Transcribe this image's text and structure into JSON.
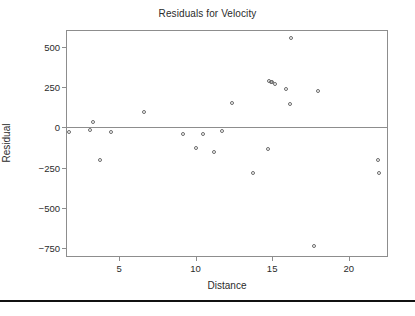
{
  "chart_data": {
    "type": "scatter",
    "title": "Residuals for Velocity",
    "xlabel": "Distance",
    "ylabel": "Residual",
    "xlim": [
      1.6,
      22.5
    ],
    "ylim": [
      -800,
      600
    ],
    "xticks": [
      5,
      10,
      15,
      20
    ],
    "xtick_labels": [
      "5",
      "10",
      "15",
      "20"
    ],
    "yticks": [
      500,
      250,
      0,
      -250,
      -500,
      -750
    ],
    "ytick_labels": [
      "500",
      "250",
      "0",
      "-250",
      "-500",
      "-750"
    ],
    "grid": false,
    "legend": null,
    "reference_line": {
      "axis": "y",
      "value": 0
    },
    "marker": "open-circle",
    "marker_color": "#6b6b6b",
    "frame_color": "#8d8d8d",
    "points": [
      {
        "x": 1.75,
        "y": -30
      },
      {
        "x": 3.1,
        "y": -15
      },
      {
        "x": 3.3,
        "y": 35
      },
      {
        "x": 3.75,
        "y": -205
      },
      {
        "x": 4.5,
        "y": -30
      },
      {
        "x": 6.6,
        "y": 95
      },
      {
        "x": 9.2,
        "y": -40
      },
      {
        "x": 10.0,
        "y": -130
      },
      {
        "x": 10.5,
        "y": -40
      },
      {
        "x": 11.2,
        "y": -150
      },
      {
        "x": 11.7,
        "y": -20
      },
      {
        "x": 12.4,
        "y": 155
      },
      {
        "x": 13.75,
        "y": -285
      },
      {
        "x": 14.7,
        "y": -135
      },
      {
        "x": 14.8,
        "y": 290
      },
      {
        "x": 14.9,
        "y": 285
      },
      {
        "x": 15.0,
        "y": 280
      },
      {
        "x": 15.2,
        "y": 270
      },
      {
        "x": 15.9,
        "y": 240
      },
      {
        "x": 16.15,
        "y": 145
      },
      {
        "x": 16.2,
        "y": 555
      },
      {
        "x": 17.7,
        "y": -735
      },
      {
        "x": 18.0,
        "y": 225
      },
      {
        "x": 21.9,
        "y": -200
      },
      {
        "x": 21.95,
        "y": -285
      }
    ]
  }
}
